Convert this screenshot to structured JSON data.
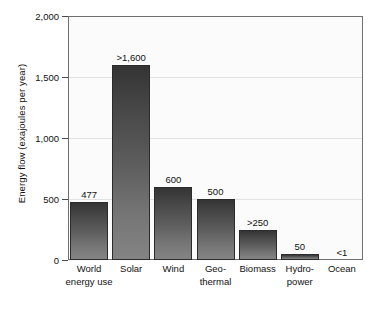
{
  "chart_data": {
    "type": "bar",
    "title": "",
    "xlabel": "",
    "ylabel": "Energy flow (exajoules per year)",
    "ylim": [
      0,
      2000
    ],
    "yticks": [
      0,
      500,
      1000,
      1500,
      2000
    ],
    "ytick_labels": [
      "0",
      "500",
      "1,000",
      "1,500",
      "2,000"
    ],
    "grid": true,
    "legend": "none",
    "categories": [
      "World energy use",
      "Solar",
      "Wind",
      "Geo-thermal",
      "Biomass",
      "Hydro-power",
      "Ocean"
    ],
    "category_lines": [
      [
        "World",
        "energy use"
      ],
      [
        "Solar"
      ],
      [
        "Wind"
      ],
      [
        "Geo-",
        "thermal"
      ],
      [
        "Biomass"
      ],
      [
        "Hydro-",
        "power"
      ],
      [
        "Ocean"
      ]
    ],
    "values": [
      477,
      1600,
      600,
      500,
      250,
      50,
      1
    ],
    "data_labels": [
      "477",
      ">1,600",
      "600",
      "500",
      ">250",
      "50",
      "<1"
    ],
    "bar_color_top": "#343434",
    "bar_color_bottom": "#848484",
    "plot_background": "#fbfbfb",
    "grid_color": "#e2e2e2",
    "axis_color": "#6f6f6f"
  }
}
